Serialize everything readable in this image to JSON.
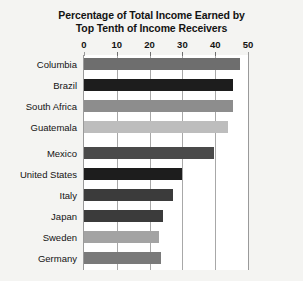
{
  "chart_data": {
    "type": "bar",
    "orientation": "horizontal",
    "title": "Percentage of Total Income Earned by Top Tenth of Income Receivers",
    "title_lines": [
      "Percentage of Total Income Earned by",
      "Top Tenth of Income Receivers"
    ],
    "xlabel": "",
    "ylabel": "",
    "xlim": [
      0,
      50
    ],
    "xticks": [
      0,
      10,
      20,
      30,
      40,
      50
    ],
    "xtick_labels": [
      "0",
      "10",
      "20",
      "30",
      "40",
      "50"
    ],
    "grid": true,
    "grid_axis": "x",
    "axis_position": "top",
    "legend": false,
    "categories": [
      "Columbia",
      "Brazil",
      "South Africa",
      "Guatemala",
      "Mexico",
      "United States",
      "Italy",
      "Japan",
      "Sweden",
      "Germany"
    ],
    "values": [
      47.5,
      45.5,
      45.5,
      44,
      39.5,
      30,
      27,
      24,
      23,
      23.5
    ],
    "bar_colors": [
      "#6e6e6e",
      "#1d1d1d",
      "#8d8d8d",
      "#bdbdbd",
      "#4a4a4a",
      "#1d1d1d",
      "#3b3b3b",
      "#3b3b3b",
      "#a3a3a3",
      "#7a7a7a"
    ]
  },
  "style": {
    "background": "#f4f4f2",
    "plot_background": "#ffffff",
    "grid_color": "#a8a8a8",
    "text_color": "#131313"
  }
}
